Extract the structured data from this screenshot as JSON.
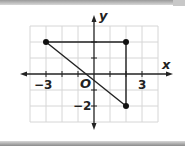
{
  "figure": {
    "axis_labels": {
      "x": "x",
      "y": "y",
      "origin": "O"
    },
    "tick_labels": {
      "x_neg": "−3",
      "x_pos": "3",
      "y_neg": "−2"
    },
    "grid": {
      "x_min": -4,
      "x_max": 4,
      "y_min": -3,
      "y_max": 3
    },
    "points": [
      {
        "label": "A",
        "x": -3,
        "y": 2
      },
      {
        "label": "B",
        "x": 2,
        "y": 2
      },
      {
        "label": "C",
        "x": 2,
        "y": -2
      }
    ],
    "segments": [
      {
        "from": [
          -3,
          2
        ],
        "to": [
          2,
          2
        ]
      },
      {
        "from": [
          2,
          2
        ],
        "to": [
          2,
          -2
        ]
      },
      {
        "from": [
          -3,
          2
        ],
        "to": [
          2,
          -2
        ]
      }
    ],
    "colors": {
      "grid": "#d6d6d6",
      "axis": "#222222",
      "shape": "#222222"
    }
  }
}
